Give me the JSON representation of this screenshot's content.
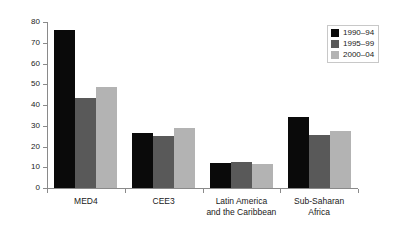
{
  "chart_data": {
    "type": "bar",
    "title": "",
    "xlabel": "",
    "ylabel": "",
    "ylim": [
      0,
      80
    ],
    "ytick_step": 10,
    "yticks": [
      80,
      70,
      60,
      50,
      40,
      30,
      20,
      10,
      0
    ],
    "grid": false,
    "legend_position": "top-right",
    "categories": [
      "MED4",
      "CEE3",
      "Latin America\nand the Caribbean",
      "Sub-Saharan\nAfrica"
    ],
    "series": [
      {
        "name": "1990–94",
        "color": "#0a0a0a",
        "values": [
          76,
          26.5,
          12,
          34
        ]
      },
      {
        "name": "1995–99",
        "color": "#595959",
        "values": [
          43.5,
          25,
          12.5,
          25.5
        ]
      },
      {
        "name": "2000–04",
        "color": "#b3b3b3",
        "values": [
          48.5,
          29,
          11.5,
          27.5
        ]
      }
    ]
  },
  "legend": {
    "items": [
      {
        "label": "1990–94"
      },
      {
        "label": "1995–99"
      },
      {
        "label": "2000–04"
      }
    ]
  },
  "axis": {
    "y_tick_labels": [
      "80",
      "70",
      "60",
      "50",
      "40",
      "30",
      "20",
      "10",
      "0"
    ],
    "x_tick_labels": [
      "MED4",
      "CEE3",
      "Latin America\nand the Caribbean",
      "Sub-Saharan\nAfrica"
    ]
  }
}
